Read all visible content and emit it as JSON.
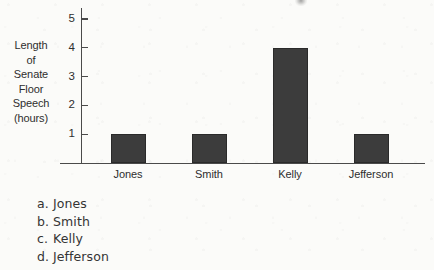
{
  "chart_data": {
    "type": "bar",
    "title": "",
    "xlabel": "",
    "ylabel": "Length of Senate Floor Speech (hours)",
    "ylabel_lines": [
      "Length",
      "of",
      "Senate",
      "Floor",
      "Speech",
      "(hours)"
    ],
    "categories": [
      "Jones",
      "Smith",
      "Kelly",
      "Jefferson"
    ],
    "values": [
      1,
      1,
      4,
      1
    ],
    "ylim": [
      0,
      5.5
    ],
    "yticks": [
      1,
      2,
      3,
      4,
      5
    ],
    "ytick_labels": [
      "1",
      "2",
      "3",
      "4",
      "5"
    ],
    "grid": false,
    "legend": false,
    "bar_color": "#3c3c3c",
    "axis_color": "#4a4a4a"
  },
  "question": {
    "answers": [
      {
        "letter": "a.",
        "text": "Jones"
      },
      {
        "letter": "b.",
        "text": "Smith"
      },
      {
        "letter": "c.",
        "text": "Kelly"
      },
      {
        "letter": "d.",
        "text": "Jefferson"
      }
    ]
  },
  "page": {
    "background_color": "#fbfbf9"
  }
}
